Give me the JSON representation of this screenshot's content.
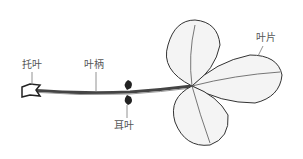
{
  "figure": {
    "labels": {
      "stipule": "托叶",
      "petiole": "叶柄",
      "auricle": "耳叶",
      "leaflet": "叶片"
    },
    "colors": {
      "ink": "#333333",
      "label": "#555555",
      "background": "#ffffff"
    }
  }
}
